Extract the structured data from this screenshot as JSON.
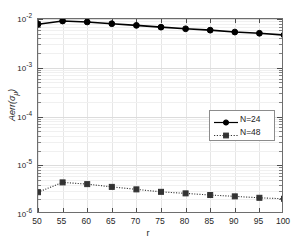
{
  "chart_data": {
    "type": "line",
    "title": "",
    "xlabel": "r",
    "ylabel": "Aerr(σ_μ)",
    "ylabel_main": "Aerr(",
    "ylabel_sym": "σ",
    "ylabel_sub": "μ",
    "ylabel_end": ")",
    "yscale": "log",
    "xscale": "linear",
    "xlim": [
      50,
      100
    ],
    "ylim": [
      1e-06,
      0.01
    ],
    "grid": true,
    "legend_position": "right-center",
    "x": [
      50,
      55,
      60,
      65,
      70,
      75,
      80,
      85,
      90,
      95,
      100
    ],
    "xticks": [
      "50",
      "55",
      "60",
      "65",
      "70",
      "75",
      "80",
      "85",
      "90",
      "95",
      "100"
    ],
    "yticks": [
      "10⁻²",
      "10⁻³",
      "10⁻⁴",
      "10⁻⁵",
      "10⁻⁶"
    ],
    "ytick_values": [
      0.01,
      0.001,
      0.0001,
      1e-05,
      1e-06
    ],
    "ytick_mantissa": [
      "10",
      "10",
      "10",
      "10",
      "10"
    ],
    "ytick_exponent": [
      "-2",
      "-3",
      "-4",
      "-5",
      "-6"
    ],
    "series": [
      {
        "name": "N=24",
        "style": "solid",
        "marker": "circle-filled",
        "color": "#000000",
        "values": [
          0.0078,
          0.0091,
          0.0087,
          0.008,
          0.0074,
          0.0068,
          0.0063,
          0.0059,
          0.0054,
          0.0051,
          0.0047
        ]
      },
      {
        "name": "N=48",
        "style": "dotted",
        "marker": "square-filled",
        "color": "#333333",
        "values": [
          2.8e-06,
          4.45e-06,
          4.1e-06,
          3.6e-06,
          3.2e-06,
          2.85e-06,
          2.65e-06,
          2.45e-06,
          2.3e-06,
          2.15e-06,
          2.05e-06
        ]
      }
    ]
  },
  "legend": {
    "entries": [
      {
        "label": "N=24"
      },
      {
        "label": "N=48"
      }
    ]
  }
}
